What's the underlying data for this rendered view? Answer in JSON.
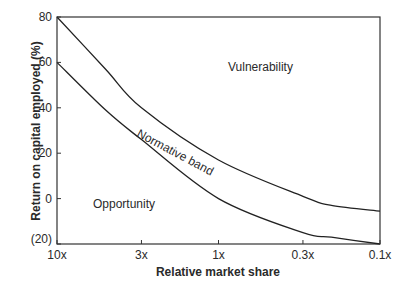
{
  "chart_data": {
    "type": "line",
    "title": "",
    "xlabel": "Relative market share",
    "ylabel": "Return on capital employed (%)",
    "x_scale": "log (reversed)",
    "x_ticks": [
      "10x",
      "3x",
      "1x",
      "0.3x",
      "0.1x"
    ],
    "x_values": [
      10,
      3,
      1,
      0.3,
      0.1
    ],
    "y_ticks": [
      "80",
      "60",
      "40",
      "20",
      "0",
      "(20)"
    ],
    "y_tick_values": [
      80,
      60,
      40,
      20,
      0,
      -20
    ],
    "ylim": [
      -20,
      80
    ],
    "grid": false,
    "legend": "none",
    "series": [
      {
        "name": "Upper boundary",
        "x": [
          10,
          5,
          3,
          1,
          0.3,
          0.2,
          0.1
        ],
        "values": [
          80,
          57,
          40,
          17,
          1,
          -3,
          -5.5
        ]
      },
      {
        "name": "Lower boundary",
        "x": [
          10,
          5,
          3,
          1,
          0.3,
          0.2,
          0.1
        ],
        "values": [
          60,
          39,
          26,
          0,
          -15,
          -17,
          -20
        ]
      }
    ],
    "annotations": [
      {
        "text": "Vulnerability",
        "x": 0.45,
        "y": 62
      },
      {
        "text": "Normative band",
        "x": 1.6,
        "y": 24,
        "rotation": 28
      },
      {
        "text": "Opportunity",
        "x": 5,
        "y": 1
      }
    ]
  }
}
